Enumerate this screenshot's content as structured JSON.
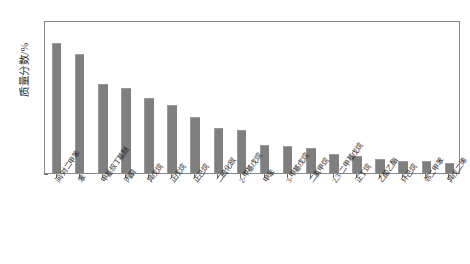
{
  "chart_data": {
    "type": "bar",
    "title": "",
    "subtitle": "",
    "xlabel": "",
    "ylabel": "质量分数/%",
    "ylim": [
      0,
      14
    ],
    "ytick_labels": [
      "0",
      "2.0",
      "4.0",
      "6.0",
      "8.0",
      "10.0",
      "12.0",
      "14.0"
    ],
    "ytick_values": [
      0,
      2,
      4,
      6,
      8,
      10,
      12,
      14
    ],
    "grid": false,
    "legend": null,
    "bar_color": "#7f7f7f",
    "axis_color": "#8a8a8a",
    "categories": [
      "间/对二甲苯",
      "苯",
      "甲基叔丁基醚",
      "丙酮",
      "异戊烷",
      "正戊烷",
      "正己烷",
      "二硫化碳",
      "2-甲基戊烷",
      "甲苯",
      "3-甲基戊烷",
      "二氯甲烷",
      "2,3-二甲基戊烷",
      "正丁烷",
      "乙酸乙酯",
      "环己烷",
      "邻二甲苯",
      "异戊二烯"
    ],
    "values": [
      11.9,
      10.9,
      8.1,
      7.8,
      6.9,
      6.2,
      5.1,
      4.1,
      3.9,
      2.6,
      2.5,
      2.3,
      1.7,
      1.6,
      1.3,
      1.1,
      1.1,
      0.9
    ]
  }
}
